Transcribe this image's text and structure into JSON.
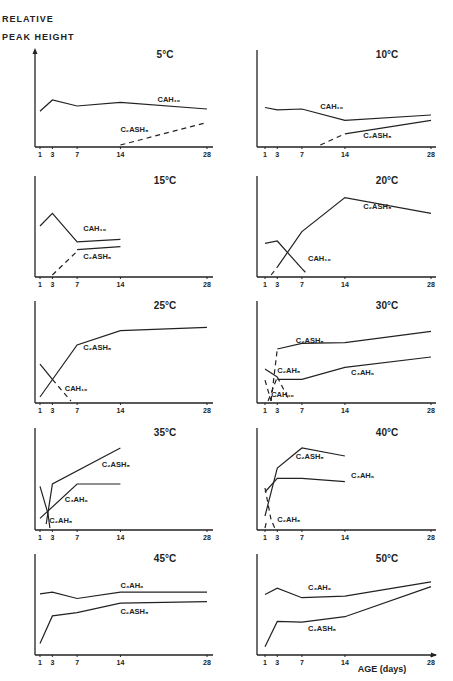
{
  "figure": {
    "ylabel_line1": "RELATIVE",
    "ylabel_line2": "PEAK HEIGHT",
    "xlabel": "AGE (days)"
  },
  "chart_data": {
    "type": "line",
    "title": "",
    "xlabel": "AGE (days)",
    "ylabel": "RELATIVE PEAK HEIGHT",
    "x_ticks": [
      1,
      3,
      7,
      14,
      28
    ],
    "grid": false,
    "note": "Relative peak heights estimated on 0-100 scale (no numeric y-axis in figure). Dashed lines drawn as dashed.",
    "panels": [
      {
        "title": "5°C",
        "series": [
          {
            "name": "CAH10",
            "dashed": false,
            "x": [
              1,
              3,
              7,
              14,
              28
            ],
            "y": [
              45,
              60,
              52,
              57,
              48
            ],
            "label_at": [
              20,
              57
            ]
          },
          {
            "name": "C2ASH8",
            "dashed": true,
            "x": [
              14,
              28
            ],
            "y": [
              0,
              30
            ],
            "label_at": [
              14,
              18
            ]
          }
        ]
      },
      {
        "title": "10°C",
        "series": [
          {
            "name": "CAH10",
            "dashed": false,
            "x": [
              1,
              3,
              7,
              14,
              28
            ],
            "y": [
              50,
              47,
              48,
              33,
              40
            ],
            "label_at": [
              10,
              48
            ]
          },
          {
            "name": "C2ASH8",
            "dashed": true,
            "x": [
              10,
              14
            ],
            "y": [
              0,
              15
            ],
            "label_at": [
              17,
              10
            ]
          },
          {
            "name": "C2ASH8",
            "dashed": false,
            "x": [
              14,
              28
            ],
            "y": [
              15,
              33
            ],
            "label_at": null
          }
        ]
      },
      {
        "title": "15°C",
        "series": [
          {
            "name": "CAH10",
            "dashed": false,
            "x": [
              1,
              3,
              7,
              14
            ],
            "y": [
              62,
              78,
              42,
              45
            ],
            "label_at": [
              8,
              56
            ]
          },
          {
            "name": "C2ASH8",
            "dashed": true,
            "x": [
              3,
              7
            ],
            "y": [
              0,
              30
            ],
            "label_at": null
          },
          {
            "name": "C2ASH8",
            "dashed": false,
            "x": [
              7,
              14
            ],
            "y": [
              32,
              36
            ],
            "label_at": [
              8,
              20
            ]
          }
        ]
      },
      {
        "title": "20°C",
        "series": [
          {
            "name": "C2ASH8",
            "dashed": true,
            "x": [
              2,
              3
            ],
            "y": [
              0,
              10
            ],
            "label_at": [
              17,
              84
            ]
          },
          {
            "name": "C2ASH8",
            "dashed": false,
            "x": [
              3,
              7,
              14,
              28
            ],
            "y": [
              10,
              55,
              98,
              78
            ],
            "label_at": null
          },
          {
            "name": "CAH10",
            "dashed": false,
            "x": [
              1,
              3,
              7
            ],
            "y": [
              40,
              43,
              8
            ],
            "label_at": [
              8,
              18
            ]
          },
          {
            "name": "CAH10",
            "dashed": true,
            "x": [
              7,
              8
            ],
            "y": [
              8,
              0
            ],
            "label_at": null
          }
        ]
      },
      {
        "title": "25°C",
        "series": [
          {
            "name": "C2ASH8",
            "dashed": false,
            "x": [
              1,
              7,
              14,
              28
            ],
            "y": [
              5,
              70,
              88,
              92
            ],
            "label_at": [
              8,
              64
            ]
          },
          {
            "name": "CAH10",
            "dashed": false,
            "x": [
              1,
              3
            ],
            "y": [
              46,
              27
            ],
            "label_at": null
          },
          {
            "name": "CAH10",
            "dashed": true,
            "x": [
              3,
              6
            ],
            "y": [
              27,
              0
            ],
            "label_at": [
              5,
              12
            ]
          }
        ]
      },
      {
        "title": "30°C",
        "series": [
          {
            "name": "C2ASH8",
            "dashed": true,
            "x": [
              2,
              3
            ],
            "y": [
              0,
              65
            ],
            "label_at": [
              6,
              72
            ]
          },
          {
            "name": "C2ASH8",
            "dashed": false,
            "x": [
              3,
              7,
              14,
              28
            ],
            "y": [
              65,
              72,
              73,
              87
            ],
            "label_at": null
          },
          {
            "name": "C3AH6",
            "dashed": false,
            "x": [
              3,
              7,
              14,
              28
            ],
            "y": [
              27,
              27,
              42,
              55
            ],
            "label_at": [
              15,
              32
            ]
          },
          {
            "name": "C2AH8",
            "dashed": false,
            "x": [
              1,
              3
            ],
            "y": [
              40,
              30
            ],
            "label_at": [
              3,
              35
            ]
          },
          {
            "name": "C2AH8",
            "dashed": true,
            "x": [
              3,
              5
            ],
            "y": [
              30,
              0
            ],
            "label_at": null
          },
          {
            "name": "CAH10",
            "dashed": true,
            "x": [
              1,
              2
            ],
            "y": [
              26,
              0
            ],
            "label_at": [
              2,
              5
            ]
          },
          {
            "name": "C3AH6",
            "dashed": true,
            "x": [
              1.5,
              3
            ],
            "y": [
              0,
              30
            ],
            "label_at": null
          }
        ]
      },
      {
        "title": "35°C",
        "series": [
          {
            "name": "C2ASH8",
            "dashed": false,
            "x": [
              2,
              3,
              14
            ],
            "y": [
              5,
              55,
              100
            ],
            "label_at": [
              11,
              76
            ]
          },
          {
            "name": "C3AH6",
            "dashed": false,
            "x": [
              1,
              7,
              14
            ],
            "y": [
              12,
              55,
              55
            ],
            "label_at": [
              5,
              32
            ]
          },
          {
            "name": "C2AH8",
            "dashed": false,
            "x": [
              1,
              2.3,
              2.6
            ],
            "y": [
              52,
              18,
              0
            ],
            "label_at": [
              2.5,
              6
            ]
          }
        ]
      },
      {
        "title": "40°C",
        "series": [
          {
            "name": "C2ASH8",
            "dashed": false,
            "x": [
              1,
              3,
              7,
              14
            ],
            "y": [
              15,
              75,
              100,
              90
            ],
            "label_at": [
              6,
              86
            ]
          },
          {
            "name": "C3AH6",
            "dashed": false,
            "x": [
              1,
              3,
              7,
              14
            ],
            "y": [
              45,
              62,
              62,
              58
            ],
            "label_at": [
              15,
              62
            ]
          },
          {
            "name": "C2AH8",
            "dashed": true,
            "x": [
              1,
              2,
              2.6
            ],
            "y": [
              50,
              10,
              0
            ],
            "label_at": [
              3,
              8
            ]
          },
          {
            "name": "C2AH8",
            "dashed": true,
            "x": [
              1,
              1.3
            ],
            "y": [
              0,
              10
            ],
            "label_at": null
          }
        ]
      },
      {
        "title": "45°C",
        "series": [
          {
            "name": "C3AH6",
            "dashed": false,
            "x": [
              1,
              3,
              7,
              14,
              28
            ],
            "y": [
              75,
              77,
              69,
              77,
              77
            ],
            "label_at": [
              14,
              82
            ]
          },
          {
            "name": "C2ASH8",
            "dashed": false,
            "x": [
              1,
              3,
              7,
              14,
              28
            ],
            "y": [
              12,
              47,
              51,
              63,
              65
            ],
            "label_at": [
              14,
              50
            ]
          }
        ]
      },
      {
        "title": "50°C",
        "series": [
          {
            "name": "C3AH6",
            "dashed": false,
            "x": [
              1,
              3,
              7,
              14,
              28
            ],
            "y": [
              74,
              82,
              70,
              72,
              90
            ],
            "label_at": [
              8,
              80
            ]
          },
          {
            "name": "C2ASH8",
            "dashed": false,
            "x": [
              1,
              3,
              7,
              14,
              28
            ],
            "y": [
              8,
              40,
              39,
              46,
              84
            ],
            "label_at": [
              8,
              28
            ]
          }
        ]
      }
    ]
  }
}
